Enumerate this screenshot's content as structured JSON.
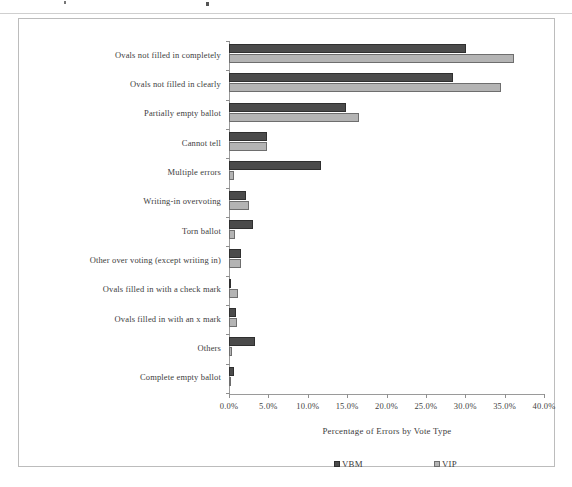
{
  "chart_data": {
    "type": "bar",
    "orientation": "horizontal",
    "title": "",
    "xlabel": "Percentage of Errors by Vote Type",
    "ylabel": "",
    "xlim": [
      0,
      40
    ],
    "xtick_labels": [
      "0.0%",
      "5.0%",
      "10.0%",
      "15.0%",
      "20.0%",
      "25.0%",
      "30.0%",
      "35.0%",
      "40.0%"
    ],
    "xtick_values": [
      0,
      5,
      10,
      15,
      20,
      25,
      30,
      35,
      40
    ],
    "grid": false,
    "legend_position": "bottom",
    "categories": [
      "Ovals not filled in completely",
      "Ovals not filled in clearly",
      "Partially empty ballot",
      "Cannot tell",
      "Multiple errors",
      "Writing-in overvoting",
      "Torn ballot",
      "Other over voting (except writing in)",
      "Ovals filled in with a check mark",
      "Ovals filled in with an x mark",
      "Others",
      "Complete empty ballot"
    ],
    "series": [
      {
        "name": "VBM",
        "color": "#4b4b4b",
        "values": [
          30.1,
          28.4,
          14.9,
          4.8,
          11.7,
          2.2,
          3.1,
          1.5,
          0.3,
          0.9,
          3.3,
          0.6
        ]
      },
      {
        "name": "VIP",
        "color": "#b4b4b4",
        "values": [
          36.2,
          34.5,
          16.5,
          4.8,
          0.6,
          2.6,
          0.7,
          1.5,
          1.1,
          1.0,
          0.4,
          0.3
        ]
      }
    ]
  },
  "legend": {
    "items": [
      {
        "label": "VBM",
        "swatch": "vbm"
      },
      {
        "label": "VIP",
        "swatch": "vip"
      }
    ]
  }
}
